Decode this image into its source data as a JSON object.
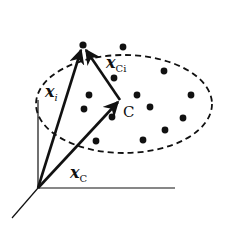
{
  "diagram": {
    "type": "vector-space-cluster",
    "colors": {
      "ink": "#111111",
      "background": "#ffffff"
    },
    "axes": {
      "origin": [
        38,
        188
      ],
      "vertical_end": [
        38,
        100
      ],
      "horizontal_end": [
        175,
        188
      ],
      "diagonal_end": [
        12,
        218
      ]
    },
    "cluster": {
      "shape": "dashed-ellipse",
      "center": [
        124,
        104
      ],
      "rx": 88,
      "ry": 49
    },
    "points": {
      "xi": [
        83,
        45
      ],
      "C": [
        120,
        100
      ]
    },
    "dots": [
      [
        123,
        47
      ],
      [
        164,
        71
      ],
      [
        114,
        78
      ],
      [
        89,
        95
      ],
      [
        137,
        95
      ],
      [
        191,
        95
      ],
      [
        150,
        107
      ],
      [
        84,
        109
      ],
      [
        112,
        117
      ],
      [
        183,
        118
      ],
      [
        165,
        130
      ],
      [
        143,
        140
      ],
      [
        96,
        141
      ]
    ],
    "vectors": [
      {
        "name": "x_i",
        "from": [
          38,
          188
        ],
        "to": [
          83,
          45
        ]
      },
      {
        "name": "x_Ci",
        "from": [
          120,
          100
        ],
        "to": [
          83,
          45
        ]
      },
      {
        "name": "x_C",
        "from": [
          38,
          188
        ],
        "to": [
          120,
          100
        ]
      }
    ],
    "labels": {
      "xi": {
        "main": "x",
        "sub": "i"
      },
      "xCi": {
        "main": "x",
        "sub": "Ci"
      },
      "xC": {
        "main": "x",
        "sub": "C"
      },
      "C": "C"
    }
  }
}
